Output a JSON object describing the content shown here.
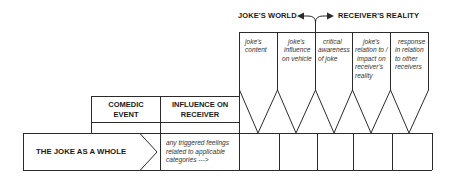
{
  "header": {
    "left_label": "JOKE'S WORLD",
    "right_label": "RECEIVER'S REALITY",
    "arrow_icon": "split-double-arrow-icon"
  },
  "columns": [
    {
      "label": "joke's content"
    },
    {
      "label": "joke's influence on vehicle"
    },
    {
      "label": "critical awareness of joke"
    },
    {
      "label": "joke's relation to / impact on receiver's reality"
    },
    {
      "label": "response in relation to other receivers"
    }
  ],
  "column_lines": [
    [
      "joke's",
      "content"
    ],
    [
      "joke's",
      "influence",
      "on vehicle"
    ],
    [
      "critical",
      "awareness",
      "of joke"
    ],
    [
      "joke's",
      "relation to /",
      "impact on",
      "receiver's",
      "reality"
    ],
    [
      "response",
      "in relation",
      "to other",
      "receivers"
    ]
  ],
  "table": {
    "headers": [
      "COMEDIC EVENT",
      "INFLUENCE ON RECEIVER"
    ],
    "header_lines": [
      [
        "COMEDIC",
        "EVENT"
      ],
      [
        "INFLUENCE ON",
        "RECEIVER"
      ]
    ],
    "row_label": "THE JOKE AS A WHOLE",
    "note_lines": [
      "any triggered feelings",
      "related to applicable",
      "categories  --->"
    ]
  },
  "colors": {
    "line": "#2b2b2b",
    "text": "#1a1a1a",
    "background": "#ffffff"
  }
}
